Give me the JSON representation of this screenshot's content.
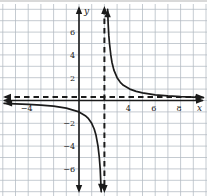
{
  "page": {
    "background": "#ffffff",
    "top_edge_color": "#cfcfcf"
  },
  "chart_data": {
    "type": "line",
    "title": "",
    "xlabel": "x",
    "ylabel": "y",
    "function": "y = 2/(x-2)",
    "grid": true,
    "unit_per_gridline": 1,
    "window": {
      "xmin": -6.2,
      "xmax": 10.1,
      "ymin": -8.4,
      "ymax": 8.1
    },
    "grid_range": {
      "x_from": -6,
      "x_to": 10,
      "y_from": -8,
      "y_to": 8
    },
    "x_tick_labels": [
      {
        "value": -4,
        "label": "-4"
      },
      {
        "value": 4,
        "label": "4"
      },
      {
        "value": 6,
        "label": "6"
      },
      {
        "value": 8,
        "label": "8"
      }
    ],
    "y_tick_labels": [
      {
        "value": 6,
        "label": "6"
      },
      {
        "value": 4,
        "label": "4"
      },
      {
        "value": 2,
        "label": "2"
      },
      {
        "value": -2,
        "label": "-2"
      },
      {
        "value": -4,
        "label": "-4"
      },
      {
        "value": -6,
        "label": "-6"
      }
    ],
    "asymptotes": {
      "vertical_x": 2,
      "horizontal_y": 0,
      "style": "dashed",
      "arrows_both_ends": true
    },
    "series": [
      {
        "name": "right-branch",
        "points": [
          [
            2.25,
            8
          ],
          [
            2.3,
            6.67
          ],
          [
            2.35,
            5.71
          ],
          [
            2.4,
            5
          ],
          [
            2.5,
            4
          ],
          [
            2.6,
            3.33
          ],
          [
            2.75,
            2.67
          ],
          [
            3,
            2
          ],
          [
            3.25,
            1.6
          ],
          [
            3.5,
            1.33
          ],
          [
            4,
            1
          ],
          [
            4.5,
            0.8
          ],
          [
            5,
            0.67
          ],
          [
            6,
            0.5
          ],
          [
            7,
            0.4
          ],
          [
            8,
            0.33
          ],
          [
            9,
            0.286
          ],
          [
            9.8,
            0.256
          ]
        ],
        "end_arrows": [
          "up",
          "right"
        ]
      },
      {
        "name": "left-branch",
        "points": [
          [
            -5.9,
            -0.253
          ],
          [
            -5,
            -0.286
          ],
          [
            -4,
            -0.333
          ],
          [
            -3,
            -0.4
          ],
          [
            -2,
            -0.5
          ],
          [
            -1,
            -0.667
          ],
          [
            0,
            -1
          ],
          [
            0.5,
            -1.333
          ],
          [
            0.75,
            -1.6
          ],
          [
            1,
            -2
          ],
          [
            1.2,
            -2.5
          ],
          [
            1.33,
            -3
          ],
          [
            1.5,
            -4
          ],
          [
            1.6,
            -5
          ],
          [
            1.67,
            -6
          ],
          [
            1.71,
            -7
          ],
          [
            1.75,
            -8
          ]
        ],
        "end_arrows": [
          "left",
          "down"
        ]
      }
    ],
    "colors": {
      "curve": "#1b1b1b",
      "axis": "#1b1b1b",
      "asymptote": "#1b1b1b",
      "grid": "#b2b9c2",
      "label": "#222222"
    }
  }
}
